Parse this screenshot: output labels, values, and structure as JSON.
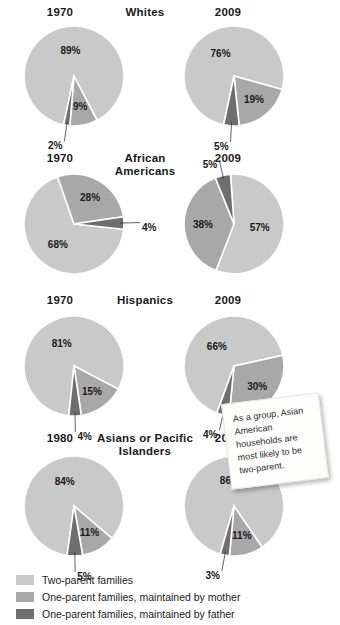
{
  "colors": {
    "two_parent": "#c9c9c9",
    "mother": "#a8a8a8",
    "father": "#6e6e6e",
    "background": "#ffffff",
    "text": "#1a1a1a",
    "note_bg": "#fdfdfb"
  },
  "legend": {
    "items": [
      {
        "label": "Two-parent families",
        "color": "#c9c9c9",
        "key": "two_parent"
      },
      {
        "label": "One-parent families, maintained by mother",
        "color": "#a8a8a8",
        "key": "mother"
      },
      {
        "label": "One-parent families, maintained by father",
        "color": "#6e6e6e",
        "key": "father"
      }
    ]
  },
  "callout": {
    "text": "As a group, Asian American households are most likely to be two-parent."
  },
  "chart_data": {
    "type": "pie",
    "title": "",
    "legend_position": "bottom",
    "series_names": [
      "Two-parent families",
      "One-parent families, maintained by mother",
      "One-parent families, maintained by father"
    ],
    "groups": [
      {
        "name": "Whites",
        "name_lines": "Whites",
        "charts": [
          {
            "year": "1970",
            "side": "left",
            "slices": [
              {
                "series": "Two-parent families",
                "label": "89%",
                "value": 89,
                "placement": "inside"
              },
              {
                "series": "One-parent families, maintained by mother",
                "label": "9%",
                "value": 9,
                "placement": "inside"
              },
              {
                "series": "One-parent families, maintained by father",
                "label": "2%",
                "value": 2,
                "placement": "outside"
              }
            ]
          },
          {
            "year": "2009",
            "side": "right",
            "slices": [
              {
                "series": "Two-parent families",
                "label": "76%",
                "value": 76,
                "placement": "inside"
              },
              {
                "series": "One-parent families, maintained by mother",
                "label": "19%",
                "value": 19,
                "placement": "inside"
              },
              {
                "series": "One-parent families, maintained by father",
                "label": "5%",
                "value": 5,
                "placement": "outside"
              }
            ]
          }
        ]
      },
      {
        "name": "African Americans",
        "name_lines": "African\nAmericans",
        "charts": [
          {
            "year": "1970",
            "side": "left",
            "slices": [
              {
                "series": "Two-parent families",
                "label": "68%",
                "value": 68,
                "placement": "inside"
              },
              {
                "series": "One-parent families, maintained by mother",
                "label": "28%",
                "value": 28,
                "placement": "inside"
              },
              {
                "series": "One-parent families, maintained by father",
                "label": "4%",
                "value": 4,
                "placement": "outside"
              }
            ]
          },
          {
            "year": "2009",
            "side": "right",
            "slices": [
              {
                "series": "Two-parent families",
                "label": "57%",
                "value": 57,
                "placement": "inside"
              },
              {
                "series": "One-parent families, maintained by mother",
                "label": "38%",
                "value": 38,
                "placement": "inside"
              },
              {
                "series": "One-parent families, maintained by father",
                "label": "5%",
                "value": 5,
                "placement": "outside"
              }
            ]
          }
        ]
      },
      {
        "name": "Hispanics",
        "name_lines": "Hispanics",
        "charts": [
          {
            "year": "1970",
            "side": "left",
            "slices": [
              {
                "series": "Two-parent families",
                "label": "81%",
                "value": 81,
                "placement": "inside"
              },
              {
                "series": "One-parent families, maintained by mother",
                "label": "15%",
                "value": 15,
                "placement": "inside"
              },
              {
                "series": "One-parent families, maintained by father",
                "label": "4%",
                "value": 4,
                "placement": "outside"
              }
            ]
          },
          {
            "year": "2009",
            "side": "right",
            "slices": [
              {
                "series": "Two-parent families",
                "label": "66%",
                "value": 66,
                "placement": "inside"
              },
              {
                "series": "One-parent families, maintained by mother",
                "label": "30%",
                "value": 30,
                "placement": "inside"
              },
              {
                "series": "One-parent families, maintained by father",
                "label": "4%",
                "value": 4,
                "placement": "outside"
              }
            ]
          }
        ]
      },
      {
        "name": "Asians or Pacific Islanders",
        "name_lines": "Asians or Pacific\nIslanders",
        "charts": [
          {
            "year": "1980",
            "side": "left",
            "slices": [
              {
                "series": "Two-parent families",
                "label": "84%",
                "value": 84,
                "placement": "inside"
              },
              {
                "series": "One-parent families, maintained by mother",
                "label": "11%",
                "value": 11,
                "placement": "inside"
              },
              {
                "series": "One-parent families, maintained by father",
                "label": "5%",
                "value": 5,
                "placement": "outside"
              }
            ]
          },
          {
            "year": "2009",
            "side": "right",
            "slices": [
              {
                "series": "Two-parent families",
                "label": "86%",
                "value": 86,
                "placement": "inside"
              },
              {
                "series": "One-parent families, maintained by mother",
                "label": "11%",
                "value": 11,
                "placement": "inside"
              },
              {
                "series": "One-parent families, maintained by father",
                "label": "3%",
                "value": 3,
                "placement": "outside"
              }
            ]
          }
        ]
      }
    ]
  }
}
